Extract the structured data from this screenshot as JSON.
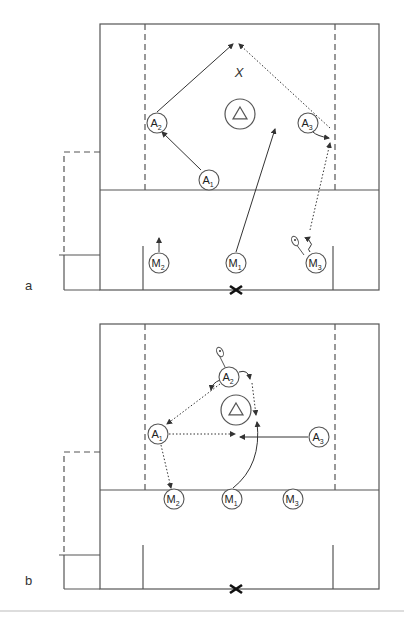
{
  "figure": {
    "width": 404,
    "height": 617,
    "line_color": "#555555",
    "bottom_rule_color": "#bbbbbb",
    "bottom_rule_y": 611
  },
  "panels": [
    {
      "id": "a",
      "label": "a",
      "label_pos": [
        25,
        290
      ],
      "field": {
        "outer": {
          "x1": 100,
          "y1": 24,
          "x2": 379,
          "y2": 290
        },
        "midline_y": 190,
        "dashed_x": [
          145,
          335
        ],
        "dashed_y_range": [
          24,
          190
        ],
        "bench_dashed": {
          "x": 64,
          "top": 152,
          "bottom": 255,
          "right": 100
        },
        "bench_solid": {
          "x": 64,
          "y": 255,
          "tick_left": 59,
          "bottom": 290
        },
        "crease_lines": [
          {
            "x": 143,
            "y1": 246,
            "y2": 290
          },
          {
            "x": 333,
            "y1": 246,
            "y2": 290
          }
        ],
        "center_x": {
          "x": 236,
          "y": 290
        }
      },
      "x_marker": {
        "label": "X",
        "x": 239,
        "y": 77
      },
      "goal": {
        "x": 240,
        "y": 114,
        "r": 15
      },
      "players": [
        {
          "name": "A",
          "sub": "2",
          "x": 157,
          "y": 123
        },
        {
          "name": "A",
          "sub": "1",
          "x": 209,
          "y": 180
        },
        {
          "name": "A",
          "sub": "3",
          "x": 308,
          "y": 123
        },
        {
          "name": "M",
          "sub": "2",
          "x": 159,
          "y": 263
        },
        {
          "name": "M",
          "sub": "1",
          "x": 236,
          "y": 263
        },
        {
          "name": "M",
          "sub": "3",
          "x": 316,
          "y": 263
        }
      ],
      "paths": [
        {
          "type": "solid",
          "d": "M 201 170 L 162 132",
          "arrow": true
        },
        {
          "type": "solid",
          "d": "M 157 112 L 233 44",
          "arrow": true
        },
        {
          "type": "dotted",
          "d": "M 330 128 L 239 44",
          "arrow": true
        },
        {
          "type": "solid",
          "d": "M 236 252 L 275 129",
          "arrow": true
        },
        {
          "type": "wavy",
          "d": "M 314 126 q 2 4 -1 6 q 4 4 16 6",
          "arrow": true
        },
        {
          "type": "dotted",
          "d": "M 310 230 L 330 143",
          "arrow": true
        },
        {
          "type": "wavy",
          "d": "M 310 252 q -3 -3 0 -5 q 3 -3 0 -5 q -3 -3 0 -5",
          "arrow": true
        },
        {
          "type": "solid",
          "d": "M 159 252 L 159 238",
          "arrow": true
        }
      ],
      "sticks": [
        {
          "x1": 304,
          "y1": 255,
          "x2": 296,
          "y2": 244,
          "hx": 295,
          "hy": 241
        }
      ]
    },
    {
      "id": "b",
      "label": "b",
      "label_pos": [
        25,
        585
      ],
      "field": {
        "outer": {
          "x1": 100,
          "y1": 324,
          "x2": 379,
          "y2": 589
        },
        "midline_y": 490,
        "dashed_x": [
          145,
          335
        ],
        "dashed_y_range": [
          324,
          490
        ],
        "bench_dashed": {
          "x": 64,
          "top": 452,
          "bottom": 555,
          "right": 100
        },
        "bench_solid": {
          "x": 64,
          "y": 555,
          "tick_left": 59,
          "bottom": 589
        },
        "crease_lines": [
          {
            "x": 143,
            "y1": 545,
            "y2": 589
          },
          {
            "x": 333,
            "y1": 545,
            "y2": 589
          }
        ],
        "center_x": {
          "x": 236,
          "y": 589
        }
      },
      "x_marker": null,
      "goal": {
        "x": 236,
        "y": 410,
        "r": 15
      },
      "players": [
        {
          "name": "A",
          "sub": "2",
          "x": 229,
          "y": 377
        },
        {
          "name": "A",
          "sub": "1",
          "x": 158,
          "y": 434
        },
        {
          "name": "A",
          "sub": "3",
          "x": 319,
          "y": 437
        },
        {
          "name": "M",
          "sub": "2",
          "x": 174,
          "y": 499
        },
        {
          "name": "M",
          "sub": "1",
          "x": 232,
          "y": 499
        },
        {
          "name": "M",
          "sub": "3",
          "x": 293,
          "y": 499
        }
      ],
      "paths": [
        {
          "type": "dotted",
          "d": "M 220 384 L 167 424",
          "arrow": true
        },
        {
          "type": "solid",
          "d": "M 220 380 q -8 3 -9 10",
          "arrow": true
        },
        {
          "type": "solid",
          "d": "M 239 372 q 9 -3 11 7",
          "arrow": true
        },
        {
          "type": "dotted",
          "d": "M 252 383 L 256 415",
          "arrow": true
        },
        {
          "type": "dotted",
          "d": "M 169 434 L 235 434",
          "arrow": true
        },
        {
          "type": "solid",
          "d": "M 308 437 L 240 437",
          "arrow": true
        },
        {
          "type": "solid",
          "d": "M 233 488 Q 262 465 257 422",
          "arrow": true
        },
        {
          "type": "dotted",
          "d": "M 161 445 L 171 488",
          "arrow": true
        }
      ],
      "sticks": [
        {
          "x1": 225,
          "y1": 367,
          "x2": 219,
          "y2": 355,
          "hx": 220,
          "hy": 352
        }
      ]
    }
  ]
}
